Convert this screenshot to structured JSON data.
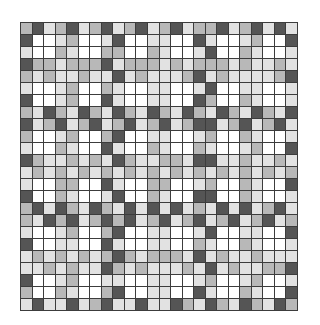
{
  "palette": {
    "W": "#ffffff",
    "L": "#e2e2e2",
    "M": "#b8b8b8",
    "D": "#555555",
    "line": "#3c3c3c"
  },
  "grid": {
    "columns": 24,
    "rows": 24,
    "cells": [
      "MDLMDLMDLMDLMDLMMDLMDLDL",
      "DWWLMWWLDWWLLWWDLWWLMWWD",
      "LWWMLWWMMWWMLWWLDWWMLWWL",
      "DMMLMMMDLMMMLMLMMMLMLLML",
      "MLMLLMLLDLMLLLMDLMLLLLMD",
      "LWWLMWWMLWWLLWWLDWWLLWWL",
      "DWWLMWWDLWWLLWWDMWWMLWWL",
      "MLDMLDMLDMLDMLDMLDMLDMLD",
      "DLMDLMDLMDLMDLMDDLMDLMDL",
      "MWWLMWWMDWWLLWWLMWWMLWWL",
      "LWWMLWWDLWWMLWWMLWWLMWWD",
      "DMLLMLMLDMLLMMLDDLLMLLML",
      "LMLMLMLMLMLMLMLMLMLMLMLM",
      "LWWMMWWDLWWMMWWLMWWMLWWD",
      "DWWMLWWLDWWMLWWDDWWMLWWL",
      "MDLDMLDMLDLDLDLMLDLDLMDL",
      "MLDMDLMDMDLMDLMDLMDLMDLM",
      "LWWLMWWMDWWLLWWLDWWLLWWD",
      "DWWLLWWDLWWLLWWMLWWMLWWL",
      "LMLMLMLMDMLMMMLDLMLLMLLL",
      "LLMLMLLDMLMLLLMLDLMLLMMD",
      "DWWLMWWLLWWLLWWLMWWLMWWL",
      "MWWMLWWMDWWLLWWDLWWMLWWD",
      "LDLLDLMDLLDLLDMLDMLDMLDM"
    ]
  }
}
